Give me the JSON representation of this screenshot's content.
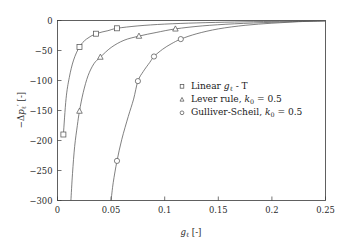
{
  "chart_data": {
    "type": "line",
    "title": "",
    "subtitle": "",
    "xlabel": "g_l [-]",
    "ylabel": "-Δp_l' [-]",
    "xlim": [
      0,
      0.25
    ],
    "ylim": [
      -300,
      0
    ],
    "grid": false,
    "legend_position": "center-right",
    "x_ticks": [
      0,
      0.05,
      0.1,
      0.15,
      0.2,
      0.25
    ],
    "x_tick_labels": [
      "0",
      "0.05",
      "0.1",
      "0.15",
      "0.2",
      "0.25"
    ],
    "y_ticks": [
      -300,
      -250,
      -200,
      -150,
      -100,
      -50,
      0
    ],
    "y_tick_labels": [
      "-300",
      "-250",
      "-200",
      "-150",
      "-100",
      "-50",
      "0"
    ],
    "series": [
      {
        "name": "Linear g_l - T",
        "marker": "square",
        "color": "#555555",
        "points": [
          [
            0.0055,
            -190
          ],
          [
            0.008,
            -130
          ],
          [
            0.011,
            -95
          ],
          [
            0.015,
            -66
          ],
          [
            0.0205,
            -44
          ],
          [
            0.027,
            -31
          ],
          [
            0.036,
            -22
          ],
          [
            0.047,
            -17
          ],
          [
            0.0555,
            -13
          ],
          [
            0.075,
            -9
          ],
          [
            0.1,
            -6
          ],
          [
            0.13,
            -4
          ],
          [
            0.165,
            -2.5
          ],
          [
            0.2,
            -1.5
          ],
          [
            0.225,
            -0.9
          ],
          [
            0.25,
            -0.4
          ]
        ],
        "marker_points": [
          [
            0.0055,
            -190
          ],
          [
            0.0205,
            -44
          ],
          [
            0.036,
            -22
          ],
          [
            0.0555,
            -13
          ]
        ]
      },
      {
        "name": "Lever rule, k_0 = 0.5",
        "marker": "triangle",
        "color": "#555555",
        "points": [
          [
            0.0125,
            -300
          ],
          [
            0.014,
            -255
          ],
          [
            0.016,
            -210
          ],
          [
            0.0185,
            -175
          ],
          [
            0.0205,
            -151
          ],
          [
            0.024,
            -120
          ],
          [
            0.0285,
            -92
          ],
          [
            0.034,
            -72
          ],
          [
            0.04,
            -61
          ],
          [
            0.05,
            -45
          ],
          [
            0.062,
            -33
          ],
          [
            0.076,
            -26
          ],
          [
            0.092,
            -20
          ],
          [
            0.11,
            -14
          ],
          [
            0.135,
            -9
          ],
          [
            0.165,
            -5.5
          ],
          [
            0.2,
            -3
          ],
          [
            0.225,
            -1.6
          ],
          [
            0.25,
            -0.5
          ]
        ],
        "marker_points": [
          [
            0.0205,
            -151
          ],
          [
            0.04,
            -61
          ],
          [
            0.076,
            -26
          ],
          [
            0.11,
            -14
          ]
        ]
      },
      {
        "name": "Gulliver-Scheil, k_0 = 0.5",
        "marker": "circle",
        "color": "#555555",
        "points": [
          [
            0.05,
            -300
          ],
          [
            0.052,
            -270
          ],
          [
            0.0555,
            -234
          ],
          [
            0.06,
            -198
          ],
          [
            0.066,
            -160
          ],
          [
            0.071,
            -131
          ],
          [
            0.075,
            -101
          ],
          [
            0.08,
            -85
          ],
          [
            0.086,
            -70
          ],
          [
            0.09,
            -60
          ],
          [
            0.098,
            -48
          ],
          [
            0.106,
            -39
          ],
          [
            0.115,
            -31
          ],
          [
            0.13,
            -22
          ],
          [
            0.15,
            -14
          ],
          [
            0.175,
            -8
          ],
          [
            0.2,
            -4.5
          ],
          [
            0.225,
            -2
          ],
          [
            0.25,
            -0.6
          ]
        ],
        "marker_points": [
          [
            0.0555,
            -234
          ],
          [
            0.075,
            -101
          ],
          [
            0.09,
            -60
          ],
          [
            0.115,
            -31
          ]
        ]
      }
    ]
  },
  "legend": {
    "entries": [
      {
        "marker": "square",
        "label_main": "Linear",
        "label_var": "g",
        "label_sub": "ℓ",
        "label_tail": " - T",
        "full": "Linear gℓ - T"
      },
      {
        "marker": "triangle",
        "label_main": "Lever rule,",
        "label_var": "k",
        "label_sub": "0",
        "label_tail": " = 0.5",
        "full": "Lever rule, k0 = 0.5"
      },
      {
        "marker": "circle",
        "label_main": "Gulliver-Scheil,",
        "label_var": "k",
        "label_sub": "0",
        "label_tail": " = 0.5",
        "full": "Gulliver-Scheil, k0 = 0.5"
      }
    ]
  },
  "axes": {
    "x_title_var": "g",
    "x_title_sub": "ℓ",
    "x_title_unit": "[-]",
    "y_title_prefix": "−Δ",
    "y_title_var": "p",
    "y_title_sub": "ℓ",
    "y_title_prime": "′",
    "y_title_unit": "[-]"
  },
  "style": {
    "curve_color": "#555555",
    "axis_color": "#3a3a3a",
    "text_color": "#1c1c1c",
    "background": "#ffffff"
  }
}
